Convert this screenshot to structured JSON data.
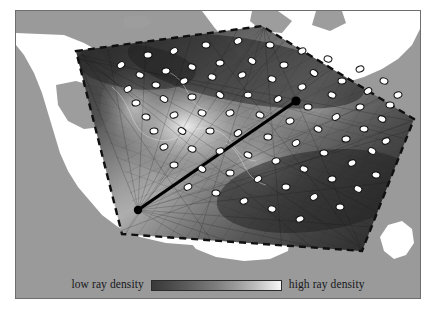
{
  "figure": {
    "type": "seismic-ray-density-map",
    "background_color": "#9a9a9a",
    "land_color": "#ffffff",
    "frame_color": "#6e6e6e"
  },
  "legend": {
    "low_label": "low ray density",
    "high_label": "high ray density",
    "colorbar": {
      "orientation": "horizontal",
      "low_color": "#393939",
      "high_color": "#f6f6f6",
      "stops": [
        "#393939",
        "#4a4a4a",
        "#636363",
        "#7e7e7e",
        "#9c9c9c",
        "#bdbdbd",
        "#dcdcdc",
        "#f6f6f6"
      ]
    }
  },
  "map": {
    "study_area_boundary": {
      "style": "dashed",
      "color": "#111111",
      "points": "64,44 241,19 394,109 344,236 111,219"
    },
    "cross_section_line": {
      "color": "#000000",
      "width_px": 3,
      "start": {
        "x": 122,
        "y": 199
      },
      "end": {
        "x": 280,
        "y": 90
      },
      "endpoint_marker": "filled-circle"
    },
    "station_marker": {
      "shape": "ellipse",
      "fill": "#ffffff",
      "stroke": "#111111",
      "count": 78
    },
    "stations": [
      [
        105,
        54
      ],
      [
        132,
        44
      ],
      [
        158,
        40
      ],
      [
        190,
        34
      ],
      [
        222,
        30
      ],
      [
        254,
        34
      ],
      [
        286,
        40
      ],
      [
        312,
        48
      ],
      [
        344,
        58
      ],
      [
        368,
        70
      ],
      [
        382,
        84
      ],
      [
        124,
        64
      ],
      [
        150,
        60
      ],
      [
        176,
        56
      ],
      [
        204,
        52
      ],
      [
        236,
        50
      ],
      [
        268,
        54
      ],
      [
        298,
        62
      ],
      [
        326,
        70
      ],
      [
        352,
        80
      ],
      [
        374,
        94
      ],
      [
        112,
        78
      ],
      [
        140,
        74
      ],
      [
        168,
        70
      ],
      [
        196,
        66
      ],
      [
        226,
        64
      ],
      [
        256,
        68
      ],
      [
        286,
        76
      ],
      [
        316,
        84
      ],
      [
        344,
        96
      ],
      [
        366,
        108
      ],
      [
        120,
        92
      ],
      [
        148,
        88
      ],
      [
        176,
        86
      ],
      [
        204,
        84
      ],
      [
        232,
        84
      ],
      [
        262,
        88
      ],
      [
        292,
        96
      ],
      [
        320,
        106
      ],
      [
        348,
        118
      ],
      [
        370,
        130
      ],
      [
        130,
        106
      ],
      [
        158,
        104
      ],
      [
        186,
        102
      ],
      [
        214,
        102
      ],
      [
        244,
        104
      ],
      [
        274,
        110
      ],
      [
        302,
        118
      ],
      [
        330,
        128
      ],
      [
        356,
        140
      ],
      [
        138,
        120
      ],
      [
        166,
        120
      ],
      [
        194,
        120
      ],
      [
        222,
        122
      ],
      [
        252,
        126
      ],
      [
        280,
        132
      ],
      [
        308,
        142
      ],
      [
        336,
        152
      ],
      [
        360,
        164
      ],
      [
        148,
        136
      ],
      [
        176,
        138
      ],
      [
        204,
        140
      ],
      [
        232,
        144
      ],
      [
        260,
        150
      ],
      [
        288,
        158
      ],
      [
        316,
        168
      ],
      [
        342,
        178
      ],
      [
        158,
        154
      ],
      [
        186,
        158
      ],
      [
        214,
        162
      ],
      [
        242,
        168
      ],
      [
        270,
        176
      ],
      [
        298,
        186
      ],
      [
        324,
        196
      ],
      [
        172,
        176
      ],
      [
        200,
        182
      ],
      [
        228,
        190
      ],
      [
        256,
        198
      ],
      [
        284,
        208
      ]
    ],
    "ray_density_field": {
      "description": "dark-to-light ray path density shading inside study area",
      "high_density_color": "#efefef",
      "low_density_color": "#2b2b2b"
    }
  }
}
